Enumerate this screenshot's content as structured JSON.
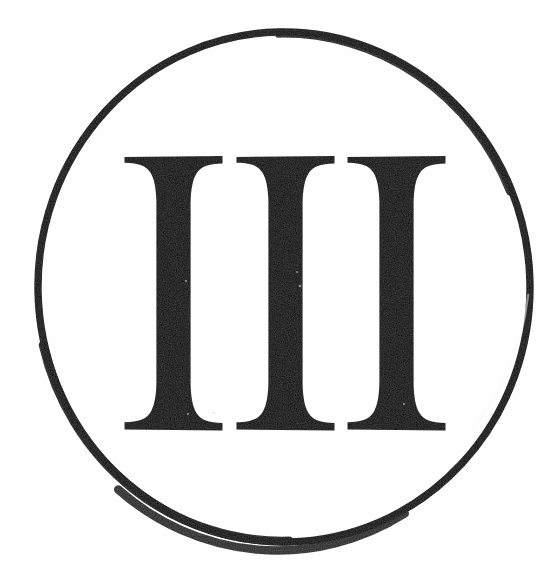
{
  "image": {
    "kind": "trademark-logo",
    "description": "Roman numeral III enclosed in a circle",
    "width": 555,
    "height": 588,
    "background_color": "#fefefe",
    "ink_color": "#100f0d",
    "alt_text": "III inside a circle"
  },
  "mark": {
    "text": "III",
    "numeral_system": "roman",
    "numeric_value": "3",
    "letter_count": 3,
    "typeface_style": "didone-serif",
    "letters": [
      {
        "glyph": "I",
        "index": "1"
      },
      {
        "glyph": "I",
        "index": "2"
      },
      {
        "glyph": "I",
        "index": "3"
      }
    ]
  },
  "enclosure": {
    "shape": "circle",
    "stroke_color": "#100f0d",
    "fill": "none",
    "center_x": 284,
    "center_y": 287,
    "radius_x": 246,
    "radius_y": 255,
    "stroke_width": "8"
  },
  "geometry": {
    "glyph_top_y": 153,
    "glyph_bottom_y": 433,
    "serif_width": 99,
    "stem_width": 54,
    "letter_origins_x": [
      124,
      236,
      347
    ],
    "letter_pitch": 111
  },
  "chart_data": null
}
